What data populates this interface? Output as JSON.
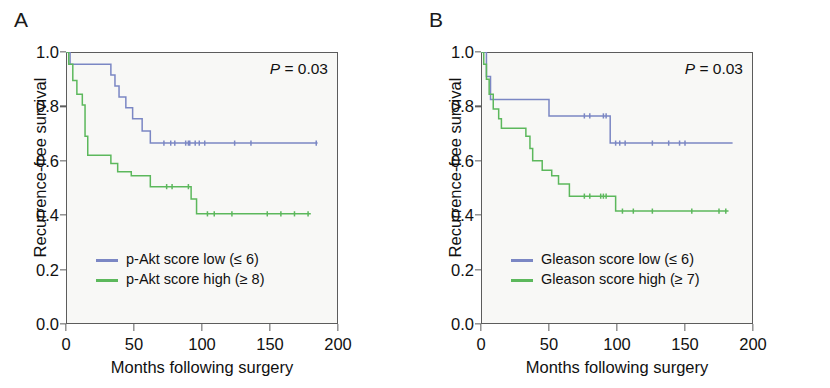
{
  "figure": {
    "axis": {
      "ylabel": "Recurrence-free survival",
      "xlabel": "Months following surgery",
      "yticks": [
        "1.0",
        "0.8",
        "0.6",
        "0.4",
        "0.2",
        "0.0"
      ],
      "xticks": [
        "0",
        "50",
        "100",
        "150",
        "200"
      ]
    },
    "colors": {
      "low": "#7b87c4",
      "high": "#5cb85c",
      "plot_bg": "#f8f8f6",
      "axis": "#5c5c5c"
    }
  },
  "panels": [
    {
      "letter": "A",
      "pvalue_prefix": "P",
      "pvalue_text": " = 0.03",
      "legend": [
        {
          "label": "p-Akt score low (≤ 6)",
          "color": "#7b87c4"
        },
        {
          "label": "p-Akt score high (≥ 8)",
          "color": "#5cb85c"
        }
      ]
    },
    {
      "letter": "B",
      "pvalue_prefix": "P",
      "pvalue_text": " = 0.03",
      "legend": [
        {
          "label": "Gleason score low (≤ 6)",
          "color": "#7b87c4"
        },
        {
          "label": "Gleason score high (≥ 7)",
          "color": "#5cb85c"
        }
      ]
    }
  ],
  "chart_data": [
    {
      "type": "line",
      "subtype": "kaplan-meier-step",
      "panel": "A",
      "title": "p-Akt score and recurrence-free survival",
      "xlabel": "Months following surgery",
      "ylabel": "Recurrence-free survival",
      "xlim": [
        0,
        200
      ],
      "ylim": [
        0.0,
        1.0
      ],
      "grid": false,
      "legend_position": "lower-left",
      "annotations": [
        {
          "text": "P = 0.03",
          "x": 150,
          "y": 0.95
        }
      ],
      "series": [
        {
          "name": "p-Akt score low (≤ 6)",
          "color": "#7b87c4",
          "steps": [
            [
              0,
              1.0
            ],
            [
              3,
              1.0
            ],
            [
              3,
              0.955
            ],
            [
              33,
              0.955
            ],
            [
              33,
              0.915
            ],
            [
              36,
              0.915
            ],
            [
              36,
              0.875
            ],
            [
              39,
              0.875
            ],
            [
              39,
              0.835
            ],
            [
              44,
              0.835
            ],
            [
              44,
              0.795
            ],
            [
              49,
              0.795
            ],
            [
              49,
              0.755
            ],
            [
              56,
              0.755
            ],
            [
              56,
              0.71
            ],
            [
              62,
              0.71
            ],
            [
              62,
              0.665
            ],
            [
              185,
              0.665
            ]
          ],
          "censored": [
            72,
            77,
            80,
            88,
            90,
            91,
            95,
            98,
            102,
            124,
            136,
            184
          ]
        },
        {
          "name": "p-Akt score high (≥ 8)",
          "color": "#5cb85c",
          "steps": [
            [
              0,
              1.0
            ],
            [
              2,
              1.0
            ],
            [
              2,
              0.955
            ],
            [
              5,
              0.955
            ],
            [
              5,
              0.895
            ],
            [
              8,
              0.895
            ],
            [
              8,
              0.845
            ],
            [
              12,
              0.845
            ],
            [
              12,
              0.805
            ],
            [
              14,
              0.805
            ],
            [
              14,
              0.69
            ],
            [
              16,
              0.69
            ],
            [
              16,
              0.62
            ],
            [
              33,
              0.62
            ],
            [
              33,
              0.59
            ],
            [
              38,
              0.59
            ],
            [
              38,
              0.56
            ],
            [
              48,
              0.56
            ],
            [
              48,
              0.545
            ],
            [
              62,
              0.545
            ],
            [
              62,
              0.505
            ],
            [
              92,
              0.505
            ],
            [
              92,
              0.46
            ],
            [
              96,
              0.46
            ],
            [
              96,
              0.405
            ],
            [
              180,
              0.405
            ]
          ],
          "censored": [
            74,
            78,
            90,
            104,
            109,
            122,
            148,
            158,
            168,
            178
          ]
        }
      ]
    },
    {
      "type": "line",
      "subtype": "kaplan-meier-step",
      "panel": "B",
      "title": "Gleason score and recurrence-free survival",
      "xlabel": "Months following surgery",
      "ylabel": "Recurrence-free survival",
      "xlim": [
        0,
        200
      ],
      "ylim": [
        0.0,
        1.0
      ],
      "grid": false,
      "legend_position": "lower-left",
      "annotations": [
        {
          "text": "P = 0.03",
          "x": 150,
          "y": 0.95
        }
      ],
      "series": [
        {
          "name": "Gleason score low (≤ 6)",
          "color": "#7b87c4",
          "steps": [
            [
              0,
              1.0
            ],
            [
              4,
              1.0
            ],
            [
              4,
              0.91
            ],
            [
              7,
              0.91
            ],
            [
              7,
              0.825
            ],
            [
              50,
              0.825
            ],
            [
              50,
              0.765
            ],
            [
              95,
              0.765
            ],
            [
              95,
              0.665
            ],
            [
              185,
              0.665
            ]
          ],
          "censored": [
            76,
            80,
            90,
            92,
            99,
            102,
            106,
            126,
            138,
            146,
            150
          ]
        },
        {
          "name": "Gleason score high (≥ 7)",
          "color": "#5cb85c",
          "steps": [
            [
              0,
              1.0
            ],
            [
              2,
              1.0
            ],
            [
              2,
              0.955
            ],
            [
              4,
              0.955
            ],
            [
              4,
              0.9
            ],
            [
              6,
              0.9
            ],
            [
              6,
              0.845
            ],
            [
              9,
              0.845
            ],
            [
              9,
              0.79
            ],
            [
              13,
              0.79
            ],
            [
              13,
              0.755
            ],
            [
              15,
              0.755
            ],
            [
              15,
              0.72
            ],
            [
              33,
              0.72
            ],
            [
              33,
              0.69
            ],
            [
              36,
              0.69
            ],
            [
              36,
              0.645
            ],
            [
              38,
              0.645
            ],
            [
              38,
              0.6
            ],
            [
              45,
              0.6
            ],
            [
              45,
              0.565
            ],
            [
              52,
              0.565
            ],
            [
              52,
              0.545
            ],
            [
              57,
              0.545
            ],
            [
              57,
              0.515
            ],
            [
              65,
              0.515
            ],
            [
              65,
              0.47
            ],
            [
              99,
              0.47
            ],
            [
              99,
              0.415
            ],
            [
              182,
              0.415
            ]
          ],
          "censored": [
            76,
            80,
            88,
            90,
            92,
            104,
            112,
            126,
            155,
            175,
            180
          ]
        }
      ]
    }
  ]
}
